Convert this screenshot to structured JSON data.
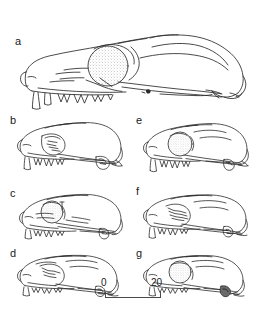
{
  "figure": {
    "caption_visible": false,
    "background_color": "#ffffff",
    "ink_color": "#2b2b2b",
    "panel_count": 7
  },
  "panels": [
    {
      "id": "a",
      "label": "a",
      "description": "lateral view of large skull with elongated rostrum, large orbit and stippled braincase",
      "column": "full",
      "row": 1
    },
    {
      "id": "b",
      "label": "b",
      "description": "lateral view of small skull, left column",
      "column": "left",
      "row": 2
    },
    {
      "id": "e",
      "label": "e",
      "description": "lateral view of small skull, right column",
      "column": "right",
      "row": 2
    },
    {
      "id": "c",
      "label": "c",
      "description": "lateral view of small skull with stippled braincase, left column",
      "column": "left",
      "row": 3
    },
    {
      "id": "f",
      "label": "f",
      "description": "lateral view of small skull, right column",
      "column": "right",
      "row": 3
    },
    {
      "id": "d",
      "label": "d",
      "description": "lateral view of small skull, left column",
      "column": "left",
      "row": 4
    },
    {
      "id": "g",
      "label": "g",
      "description": "lateral view of small skull, right column",
      "column": "right",
      "row": 4
    }
  ],
  "scale_bar": {
    "start_label": "0",
    "end_label": "20",
    "unit_visible": false,
    "line_color": "#4a4a4a",
    "start_value": 0,
    "end_value": 20,
    "length_px": 56
  }
}
